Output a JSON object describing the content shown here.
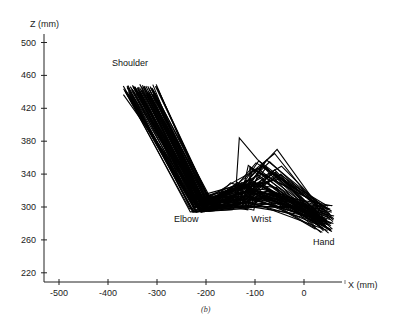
{
  "chart_data": {
    "type": "line",
    "title": "",
    "caption": "(b)",
    "xlabel": "X (mm)",
    "ylabel": "Z (mm)",
    "xlim": [
      -530,
      80
    ],
    "ylim": [
      205,
      510
    ],
    "x_ticks": [
      -500,
      -400,
      -300,
      -200,
      -100,
      0
    ],
    "y_ticks": [
      220,
      260,
      300,
      340,
      380,
      420,
      460,
      500
    ],
    "grid": false,
    "legend": null,
    "annotations": [
      {
        "text": "Shoulder",
        "x": -395,
        "z": 467
      },
      {
        "text": "Elbow",
        "x": -238,
        "z": 284
      },
      {
        "text": "Wrist",
        "x": -132,
        "z": 284
      },
      {
        "text": "Hand",
        "x": 10,
        "z": 265
      }
    ],
    "series_description": "Superimposed stick-figure arm postures (shoulder-elbow-wrist-hand) in X-Z plane",
    "representative_postures": [
      {
        "name": "posture-1",
        "points": [
          [
            -360,
            446
          ],
          [
            -228,
            296
          ],
          [
            -150,
            300
          ],
          [
            -110,
            318
          ],
          [
            60,
            280
          ]
        ]
      },
      {
        "name": "posture-2",
        "points": [
          [
            -350,
            448
          ],
          [
            -215,
            298
          ],
          [
            -135,
            322
          ],
          [
            -90,
            330
          ],
          [
            55,
            272
          ]
        ]
      },
      {
        "name": "posture-3",
        "points": [
          [
            -340,
            445
          ],
          [
            -205,
            302
          ],
          [
            -140,
            326
          ],
          [
            -60,
            365
          ],
          [
            40,
            290
          ]
        ]
      },
      {
        "name": "posture-4",
        "points": [
          [
            -320,
            440
          ],
          [
            -195,
            306
          ],
          [
            -130,
            320
          ],
          [
            -70,
            355
          ],
          [
            60,
            284
          ]
        ]
      },
      {
        "name": "posture-outlier",
        "points": [
          [
            -345,
            446
          ],
          [
            -220,
            300
          ],
          [
            -140,
            312
          ],
          [
            -132,
            384
          ],
          [
            -95,
            358
          ],
          [
            45,
            276
          ]
        ]
      },
      {
        "name": "posture-6",
        "points": [
          [
            -365,
            442
          ],
          [
            -232,
            294
          ],
          [
            -120,
            298
          ],
          [
            -80,
            312
          ],
          [
            50,
            278
          ]
        ]
      },
      {
        "name": "posture-7",
        "points": [
          [
            -310,
            444
          ],
          [
            -190,
            310
          ],
          [
            -125,
            326
          ],
          [
            -55,
            370
          ],
          [
            30,
            300
          ]
        ]
      }
    ]
  },
  "plot": {
    "generated_families": {
      "count": 70,
      "shoulder_x_range": [
        -368,
        -300
      ],
      "shoulder_z_range": [
        436,
        450
      ],
      "elbow_x_range": [
        -235,
        -185
      ],
      "elbow_z_range": [
        293,
        312
      ],
      "wrist_x_range": [
        -150,
        -100
      ],
      "wrist_z_range": [
        296,
        330
      ],
      "mid_x_range": [
        -120,
        -40
      ],
      "mid_z_range": [
        300,
        372
      ],
      "hand_x_range": [
        20,
        65
      ],
      "hand_z_range": [
        268,
        302
      ]
    }
  },
  "labels": {
    "y_axis_title": "Z (mm)",
    "x_axis_title": "X (mm)",
    "shoulder": "Shoulder",
    "elbow": "Elbow",
    "wrist": "Wrist",
    "hand": "Hand",
    "caption": "(b)"
  }
}
